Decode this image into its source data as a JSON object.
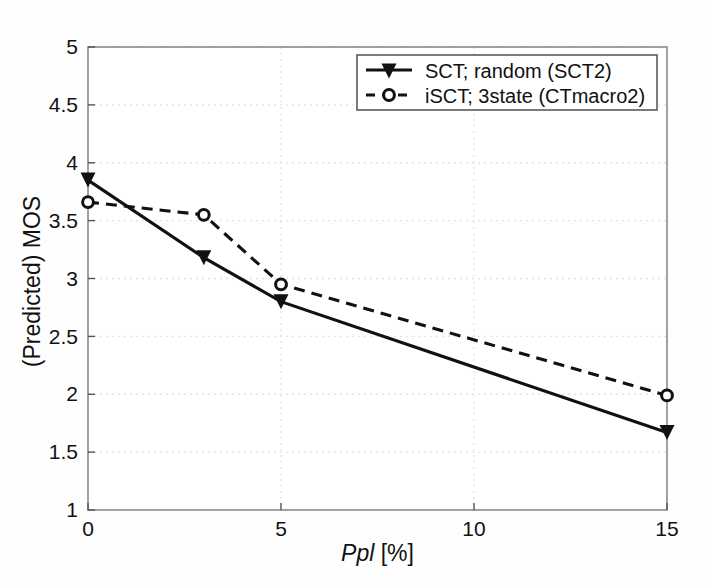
{
  "chart_data": {
    "type": "line",
    "title": "",
    "xlabel": "Ppl [%]",
    "xlabel_italic_part": "Ppl",
    "xlabel_upright_part": " [%]",
    "ylabel": "(Predicted) MOS",
    "xlim": [
      0,
      15
    ],
    "ylim": [
      1,
      5
    ],
    "xticks": [
      0,
      5,
      10,
      15
    ],
    "xtick_labels": [
      "0",
      "5",
      "10",
      "15"
    ],
    "yticks": [
      1,
      1.5,
      2,
      2.5,
      3,
      3.5,
      4,
      4.5,
      5
    ],
    "ytick_labels": [
      "1",
      "1.5",
      "2",
      "2.5",
      "3",
      "3.5",
      "4",
      "4.5",
      "5"
    ],
    "grid": true,
    "grid_style": "dotted",
    "grid_color": "#e2e2e2",
    "legend_position": "top-right",
    "x": [
      0,
      3,
      5,
      15
    ],
    "series": [
      {
        "name": "SCT; random (SCT2)",
        "values": [
          3.85,
          3.18,
          2.8,
          1.67
        ],
        "line_style": "solid",
        "marker": "triangle-down-filled",
        "color": "#111111"
      },
      {
        "name": "iSCT; 3state (CTmacro2)",
        "values": [
          3.66,
          3.55,
          2.95,
          1.99
        ],
        "line_style": "dashed",
        "marker": "circle-open",
        "color": "#111111"
      }
    ]
  },
  "legend": {
    "entries": [
      {
        "label": "SCT; random (SCT2)"
      },
      {
        "label": "iSCT; 3state (CTmacro2)"
      }
    ]
  },
  "axes": {
    "y_axis_title": "(Predicted) MOS",
    "x_axis_title_italic": "Ppl",
    "x_axis_title_rest": " [%]"
  },
  "ytick_labels": {
    "t0": "1",
    "t1": "1.5",
    "t2": "2",
    "t3": "2.5",
    "t4": "3",
    "t5": "3.5",
    "t6": "4",
    "t7": "4.5",
    "t8": "5"
  },
  "xtick_labels": {
    "t0": "0",
    "t1": "5",
    "t2": "10",
    "t3": "15"
  }
}
